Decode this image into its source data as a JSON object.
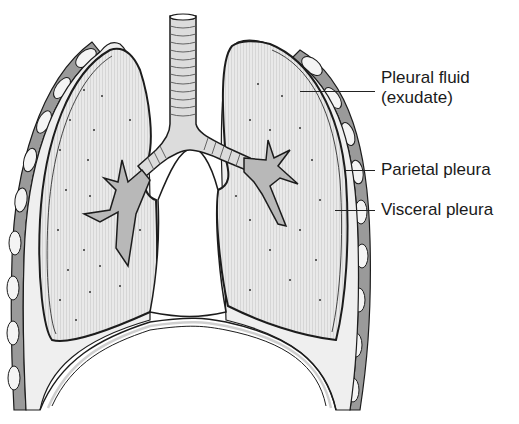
{
  "figure": {
    "colors": {
      "lung_fill": "#e6e6e6",
      "outline": "#1c1c1c",
      "airway_fill": "#b8b8b8",
      "chest_wall": "#9a9a9a",
      "rib": "#f4f4f4",
      "background": "#ffffff"
    }
  },
  "labels": [
    {
      "id": "pleural-fluid",
      "line1": "Pleural fluid",
      "line2": "(exudate)"
    },
    {
      "id": "parietal-pleura",
      "line1": "Parietal pleura"
    },
    {
      "id": "visceral-pleura",
      "line1": "Visceral pleura"
    }
  ]
}
